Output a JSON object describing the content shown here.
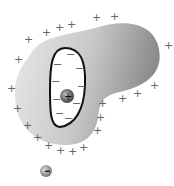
{
  "diagram": {
    "inner_charge_sign": "+",
    "outer_charge_sign": "-",
    "surface_charge_sign": "+",
    "cavity_wall_charge_sign": "-",
    "colors": {
      "conductor_light": "#e6e6e6",
      "conductor_dark": "#8e8e8e",
      "cavity_outline": "#111111",
      "charge_symbols": "#666666"
    }
  },
  "labels": {
    "plus": "+",
    "minus": "−"
  }
}
